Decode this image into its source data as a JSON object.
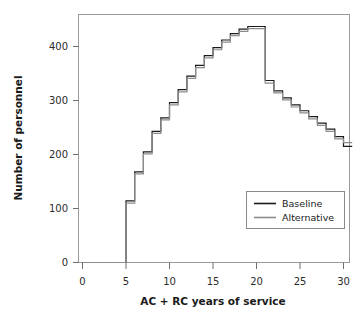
{
  "chart_data": {
    "type": "line",
    "title": "",
    "xlabel": "AC + RC years of service",
    "ylabel": "Number of personnel",
    "xlim": [
      0,
      31
    ],
    "ylim": [
      0,
      460
    ],
    "xticks": [
      0,
      5,
      10,
      15,
      20,
      25,
      30
    ],
    "yticks": [
      0,
      100,
      200,
      300,
      400
    ],
    "grid": false,
    "step": "post",
    "legend_position": "center-right",
    "x": [
      0,
      1,
      2,
      3,
      4,
      5,
      6,
      7,
      8,
      9,
      10,
      11,
      12,
      13,
      14,
      15,
      16,
      17,
      18,
      19,
      20,
      21,
      22,
      23,
      24,
      25,
      26,
      27,
      28,
      29,
      30
    ],
    "series": [
      {
        "name": "Baseline",
        "color": "#1a1a1a",
        "values": [
          0,
          0,
          0,
          0,
          0,
          114,
          168,
          205,
          243,
          268,
          296,
          320,
          345,
          365,
          383,
          398,
          412,
          424,
          432,
          437,
          437,
          337,
          318,
          305,
          292,
          281,
          270,
          258,
          247,
          233,
          215
        ]
      },
      {
        "name": "Alternative",
        "color": "#8c8c8c",
        "values": [
          0,
          0,
          0,
          0,
          0,
          110,
          164,
          201,
          239,
          264,
          292,
          316,
          341,
          361,
          379,
          394,
          408,
          420,
          428,
          433,
          433,
          332,
          314,
          301,
          288,
          277,
          266,
          254,
          243,
          229,
          222
        ]
      }
    ]
  },
  "legend": {
    "items": [
      {
        "label": "Baseline",
        "color": "#1a1a1a"
      },
      {
        "label": "Alternative",
        "color": "#8c8c8c"
      }
    ]
  },
  "axes": {
    "x_label": "AC + RC years of service",
    "y_label": "Number of personnel",
    "x_tick_labels": [
      "0",
      "5",
      "10",
      "15",
      "20",
      "25",
      "30"
    ],
    "y_tick_labels": [
      "0",
      "100",
      "200",
      "300",
      "400"
    ]
  }
}
